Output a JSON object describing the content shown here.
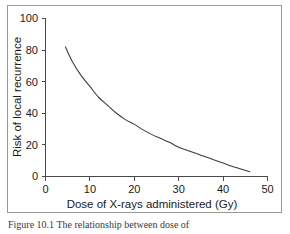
{
  "figure": {
    "caption": "Figure 10.1  The relationship between dose of",
    "frame_color": "#9a9a9a",
    "background_color": "#ffffff"
  },
  "chart_data": {
    "type": "line",
    "title": "",
    "subtitle": "",
    "xlabel": "Dose of X-rays administered (Gy)",
    "ylabel": "Risk of local recurrence",
    "xlim": [
      0,
      50
    ],
    "ylim": [
      0,
      100
    ],
    "xticks": [
      0,
      10,
      20,
      30,
      40,
      50
    ],
    "yticks": [
      0,
      20,
      40,
      60,
      80,
      100
    ],
    "xtick_labels": [
      "0",
      "10",
      "20",
      "30",
      "40",
      "50"
    ],
    "ytick_labels": [
      "0",
      "20",
      "40",
      "60",
      "80",
      "100"
    ],
    "grid": false,
    "legend": false,
    "legend_position": "none",
    "line_color": "#3d3d3d",
    "series": [
      {
        "name": "Risk of local recurrence",
        "x": [
          4.5,
          6,
          8,
          10,
          12,
          14,
          16,
          18,
          20,
          22,
          24,
          26,
          28,
          30,
          32,
          34,
          36,
          38,
          40,
          42,
          44,
          46
        ],
        "y": [
          82,
          73,
          64,
          57,
          50,
          45,
          40,
          36,
          33,
          29.5,
          26.5,
          24,
          21.5,
          18.5,
          16.5,
          14.5,
          12.5,
          10.5,
          8.5,
          6.5,
          4.8,
          3
        ]
      }
    ]
  }
}
